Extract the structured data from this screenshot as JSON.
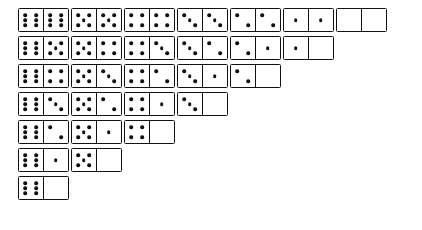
{
  "board": {
    "title": "Double-six domino set",
    "tile_count": 28,
    "max_pips": 6,
    "background_color": "#ffffff",
    "tile_border_color": "#111111",
    "pip_color": "#111111",
    "layout": {
      "type": "staircase",
      "origin_x": 18,
      "origin_y": 8,
      "column_pitch": 53,
      "row_pitch": 28,
      "tile_width": 51,
      "tile_height": 24
    },
    "columns": [
      {
        "name": "column-sixes",
        "heading": "6",
        "tiles": [
          {
            "label": "6-6",
            "left": 6,
            "right": 6
          },
          {
            "label": "6-5",
            "left": 6,
            "right": 5
          },
          {
            "label": "6-4",
            "left": 6,
            "right": 4
          },
          {
            "label": "6-3",
            "left": 6,
            "right": 3
          },
          {
            "label": "6-2",
            "left": 6,
            "right": 2
          },
          {
            "label": "6-1",
            "left": 6,
            "right": 1
          },
          {
            "label": "6-0",
            "left": 6,
            "right": 0
          }
        ]
      },
      {
        "name": "column-fives",
        "heading": "5",
        "tiles": [
          {
            "label": "5-5",
            "left": 5,
            "right": 5
          },
          {
            "label": "5-4",
            "left": 5,
            "right": 4
          },
          {
            "label": "5-3",
            "left": 5,
            "right": 3
          },
          {
            "label": "5-2",
            "left": 5,
            "right": 2
          },
          {
            "label": "5-1",
            "left": 5,
            "right": 1
          },
          {
            "label": "5-0",
            "left": 5,
            "right": 0
          }
        ]
      },
      {
        "name": "column-fours",
        "heading": "4",
        "tiles": [
          {
            "label": "4-4",
            "left": 4,
            "right": 4
          },
          {
            "label": "4-3",
            "left": 4,
            "right": 3
          },
          {
            "label": "4-2",
            "left": 4,
            "right": 2
          },
          {
            "label": "4-1",
            "left": 4,
            "right": 1
          },
          {
            "label": "4-0",
            "left": 4,
            "right": 0
          }
        ]
      },
      {
        "name": "column-threes",
        "heading": "3",
        "tiles": [
          {
            "label": "3-3",
            "left": 3,
            "right": 3
          },
          {
            "label": "3-2",
            "left": 3,
            "right": 2
          },
          {
            "label": "3-1",
            "left": 3,
            "right": 1
          },
          {
            "label": "3-0",
            "left": 3,
            "right": 0
          }
        ]
      },
      {
        "name": "column-twos",
        "heading": "2",
        "tiles": [
          {
            "label": "2-2",
            "left": 2,
            "right": 2
          },
          {
            "label": "2-1",
            "left": 2,
            "right": 1
          },
          {
            "label": "2-0",
            "left": 2,
            "right": 0
          }
        ]
      },
      {
        "name": "column-ones",
        "heading": "1",
        "tiles": [
          {
            "label": "1-1",
            "left": 1,
            "right": 1
          },
          {
            "label": "1-0",
            "left": 1,
            "right": 0
          }
        ]
      },
      {
        "name": "column-zeros",
        "heading": "0",
        "tiles": [
          {
            "label": "0-0",
            "left": 0,
            "right": 0
          }
        ]
      }
    ],
    "pip_patterns": {
      "0": [],
      "1": [
        "p-mc"
      ],
      "2": [
        "p-tl",
        "p-br"
      ],
      "3": [
        "p-tl",
        "p-mc",
        "p-br"
      ],
      "4": [
        "p-tl",
        "p-tr",
        "p-bl",
        "p-br"
      ],
      "5": [
        "p-tl",
        "p-tr",
        "p-mc",
        "p-bl",
        "p-br"
      ],
      "6": [
        "p-tl",
        "p-tr",
        "p-ml",
        "p-mr",
        "p-bl",
        "p-br"
      ]
    }
  }
}
